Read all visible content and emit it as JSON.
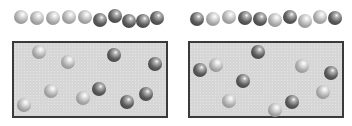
{
  "figure": {
    "colors": {
      "light_sphere": "#b0b0b0",
      "dark_sphere": "#4a4a4a",
      "box_fill": "#d6d6d6",
      "box_border": "#3a3a3a"
    },
    "panels": [
      {
        "name": "left",
        "box": {
          "x": 12,
          "y": 41,
          "w": 156,
          "h": 77
        },
        "row": [
          {
            "x": 14,
            "y": 10,
            "type": "light"
          },
          {
            "x": 30,
            "y": 11,
            "type": "light"
          },
          {
            "x": 46,
            "y": 11,
            "type": "light"
          },
          {
            "x": 62,
            "y": 10,
            "type": "light"
          },
          {
            "x": 78,
            "y": 10,
            "type": "light"
          },
          {
            "x": 93,
            "y": 13,
            "type": "dark"
          },
          {
            "x": 108,
            "y": 9,
            "type": "dark"
          },
          {
            "x": 122,
            "y": 14,
            "type": "dark"
          },
          {
            "x": 136,
            "y": 14,
            "type": "dark"
          },
          {
            "x": 150,
            "y": 11,
            "type": "dark"
          }
        ],
        "scattered": [
          {
            "x": 32,
            "y": 45,
            "type": "light"
          },
          {
            "x": 61,
            "y": 55,
            "type": "light"
          },
          {
            "x": 107,
            "y": 48,
            "type": "dark"
          },
          {
            "x": 148,
            "y": 57,
            "type": "dark"
          },
          {
            "x": 44,
            "y": 84,
            "type": "light"
          },
          {
            "x": 76,
            "y": 91,
            "type": "light"
          },
          {
            "x": 92,
            "y": 82,
            "type": "dark"
          },
          {
            "x": 120,
            "y": 95,
            "type": "dark"
          },
          {
            "x": 139,
            "y": 87,
            "type": "dark"
          },
          {
            "x": 17,
            "y": 98,
            "type": "light"
          }
        ]
      },
      {
        "name": "right",
        "box": {
          "x": 188,
          "y": 41,
          "w": 156,
          "h": 77
        },
        "row": [
          {
            "x": 190,
            "y": 12,
            "type": "dark"
          },
          {
            "x": 206,
            "y": 12,
            "type": "light"
          },
          {
            "x": 222,
            "y": 10,
            "type": "light"
          },
          {
            "x": 238,
            "y": 11,
            "type": "dark"
          },
          {
            "x": 253,
            "y": 12,
            "type": "dark"
          },
          {
            "x": 268,
            "y": 13,
            "type": "light"
          },
          {
            "x": 283,
            "y": 10,
            "type": "dark"
          },
          {
            "x": 298,
            "y": 14,
            "type": "light"
          },
          {
            "x": 313,
            "y": 10,
            "type": "light"
          },
          {
            "x": 328,
            "y": 11,
            "type": "dark"
          }
        ],
        "scattered": [
          {
            "x": 193,
            "y": 63,
            "type": "dark"
          },
          {
            "x": 209,
            "y": 58,
            "type": "light"
          },
          {
            "x": 251,
            "y": 45,
            "type": "dark"
          },
          {
            "x": 295,
            "y": 59,
            "type": "light"
          },
          {
            "x": 324,
            "y": 66,
            "type": "dark"
          },
          {
            "x": 236,
            "y": 74,
            "type": "dark"
          },
          {
            "x": 222,
            "y": 94,
            "type": "light"
          },
          {
            "x": 316,
            "y": 85,
            "type": "light"
          },
          {
            "x": 285,
            "y": 95,
            "type": "dark"
          },
          {
            "x": 268,
            "y": 103,
            "type": "light"
          }
        ]
      }
    ]
  }
}
